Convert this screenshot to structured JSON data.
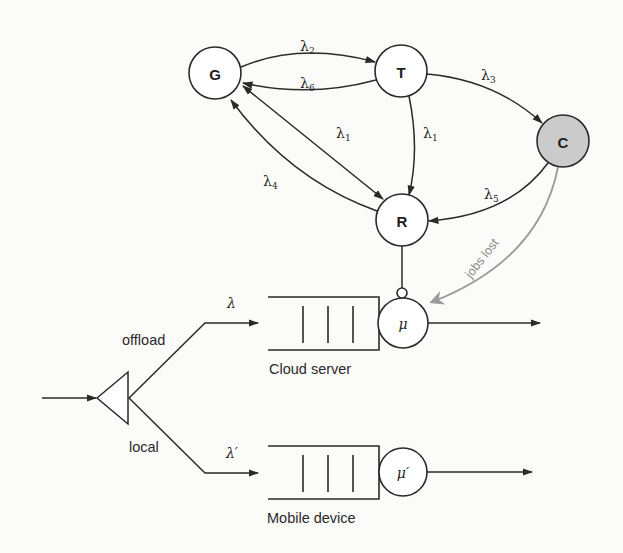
{
  "markov_chain": {
    "nodes": [
      {
        "id": "G",
        "label": "G",
        "shaded": false
      },
      {
        "id": "T",
        "label": "T",
        "shaded": false
      },
      {
        "id": "C",
        "label": "C",
        "shaded": true
      },
      {
        "id": "R",
        "label": "R",
        "shaded": false
      }
    ],
    "edges": [
      {
        "from": "G",
        "to": "T",
        "rate": "λ",
        "sub": "2"
      },
      {
        "from": "T",
        "to": "G",
        "rate": "λ",
        "sub": "6"
      },
      {
        "from": "T",
        "to": "C",
        "rate": "λ",
        "sub": "3"
      },
      {
        "from": "G",
        "to": "R",
        "rate": "λ",
        "sub": "1",
        "bidirectional": true
      },
      {
        "from": "T",
        "to": "R",
        "rate": "λ",
        "sub": "1"
      },
      {
        "from": "R",
        "to": "G",
        "rate": "λ",
        "sub": "4"
      },
      {
        "from": "C",
        "to": "R",
        "rate": "λ",
        "sub": "5"
      }
    ],
    "jobs_lost_label": "jobs lost",
    "shade_color": "#cbcbcb"
  },
  "queueing": {
    "split_labels": {
      "offload": "offload",
      "local": "local"
    },
    "cloud": {
      "arrival_rate": "λ",
      "service_rate": "μ",
      "label": "Cloud server"
    },
    "mobile": {
      "arrival_rate": "λ′",
      "service_rate": "μ′",
      "label": "Mobile device"
    }
  }
}
